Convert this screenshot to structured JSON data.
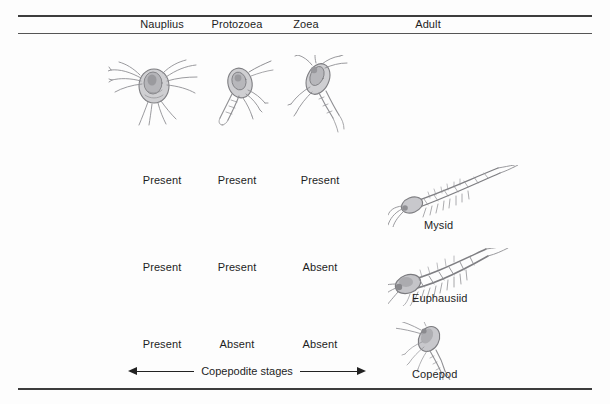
{
  "figure": {
    "columns": [
      {
        "label": "Nauplius",
        "center_x": 162
      },
      {
        "label": "Protozoea",
        "center_x": 237
      },
      {
        "label": "Zoea",
        "center_x": 306
      },
      {
        "label": "Adult",
        "center_x": 428
      }
    ],
    "rows": [
      {
        "organism": "Mysid",
        "stages": [
          "Present",
          "Present",
          "Present"
        ]
      },
      {
        "organism": "Euphausiid",
        "stages": [
          "Present",
          "Present",
          "Absent"
        ]
      },
      {
        "organism": "Copepod",
        "stages": [
          "Present",
          "Absent",
          "Absent"
        ]
      }
    ],
    "copepodite": {
      "caption": "Copepodite stages",
      "left_arrow": "left-arrow-icon",
      "right_arrow": "right-arrow-icon"
    },
    "illustrations": [
      {
        "name": "nauplius-larva-illustration",
        "stage": "Nauplius"
      },
      {
        "name": "protozoea-larva-illustration",
        "stage": "Protozoea"
      },
      {
        "name": "zoea-larva-illustration",
        "stage": "Zoea"
      },
      {
        "name": "mysid-adult-illustration",
        "stage": "Adult",
        "organism": "Mysid"
      },
      {
        "name": "euphausiid-adult-illustration",
        "stage": "Adult",
        "organism": "Euphausiid"
      },
      {
        "name": "copepod-adult-illustration",
        "stage": "Adult",
        "organism": "Copepod"
      }
    ],
    "colors": {
      "background": "#fdfdfd",
      "rule": "#3d3d3d",
      "text": "#1e1e1e",
      "illustration_ink": "#8d8d90"
    }
  }
}
